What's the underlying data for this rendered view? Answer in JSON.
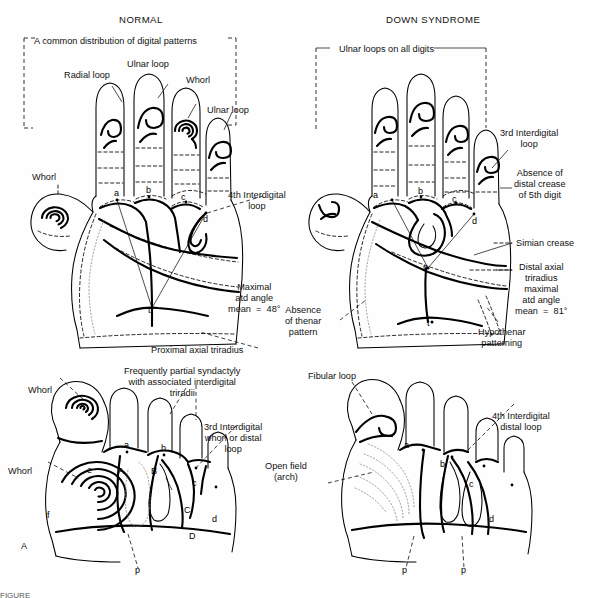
{
  "figure": {
    "panel_letter": "A",
    "background_color": "#fefefe",
    "ink_color": "#000000",
    "caption_partial": "FIGURE"
  },
  "titles": {
    "left": "NORMAL",
    "right": "DOWN SYNDROME"
  },
  "left_hand": {
    "bracket_label": "A common distribution of digital patterns",
    "labels": {
      "radial_loop": "Radial loop",
      "ulnar_loop_top": "Ulnar loop",
      "whorl_digit": "Whorl",
      "ulnar_loop_fifth": "Ulnar loop",
      "whorl_thumb": "Whorl",
      "fourth_interdigital_loop": "4th Interdigital\nloop",
      "maximal_atd": "Maximal\natd angle\nmean  =  48°",
      "proximal_axial_triradius": "Proximal axial triradius"
    },
    "triradii": [
      "a",
      "b",
      "c",
      "d",
      "t"
    ]
  },
  "right_hand": {
    "bracket_label": "Ulnar loops on all digits",
    "labels": {
      "third_interdigital_loop": "3rd Interdigital\nloop",
      "absence_distal_crease": "Absence of\ndistal crease\nof 5th digit",
      "simian_crease": "Simian crease",
      "distal_axial_triradius": "Distal axial\ntriradius\nmaximal\natd angle\nmean  =  81°",
      "absence_thenar": "Absence\nof thenar\npattern",
      "hypothenar_patterning": "Hypothenar\npatterning"
    },
    "triradii": [
      "a",
      "b",
      "c",
      "d",
      "t'",
      "t"
    ]
  },
  "left_foot": {
    "labels": {
      "whorl_hallux": "Whorl",
      "whorl_hallucal": "Whorl",
      "syndactyly": "Frequently partial syndactyly\nwith associated interdigital\ntriradii",
      "third_interdigital": "3rd Interdigital\nwhorl or distal\nloop",
      "proximal": "p"
    },
    "triradii_lower": [
      "a",
      "b",
      "c",
      "d"
    ],
    "triradii_upper": [
      "A",
      "B",
      "C",
      "D"
    ],
    "triradii_extra": [
      "e",
      "f"
    ]
  },
  "right_foot": {
    "labels": {
      "fibular_loop": "Fibular loop",
      "open_field": "Open field\n(arch)",
      "fourth_interdigital": "4th Interdigital\ndistal loop",
      "proximal_left": "p",
      "proximal_right": "p"
    },
    "triradii": [
      "a",
      "b",
      "c",
      "d"
    ]
  }
}
